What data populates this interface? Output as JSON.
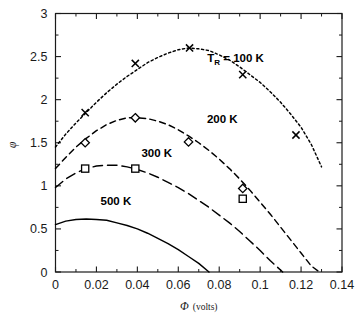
{
  "chart_data": {
    "type": "line",
    "title": "",
    "xlabel": "Φ (volts)",
    "xlabel_symbol": "Φ",
    "xlabel_units": "(volts)",
    "ylabel": "φ",
    "xlim": [
      0,
      0.14
    ],
    "ylim": [
      0,
      3
    ],
    "xticks": [
      0,
      0.02,
      0.04,
      0.06,
      0.08,
      0.1,
      0.12,
      0.14
    ],
    "xticklabels": [
      "0",
      "0.02",
      "0.04",
      "0.06",
      "0.08",
      "0.1",
      "0.12",
      "0.14"
    ],
    "yticks": [
      0,
      0.5,
      1,
      1.5,
      2,
      2.5,
      3
    ],
    "yticklabels": [
      "0",
      "0.5",
      "1",
      "1.5",
      "2",
      "2.5",
      "3"
    ],
    "grid": false,
    "legend": "inline-curve-labels",
    "minor_ticks": true,
    "series": [
      {
        "name": "100 K",
        "label": "T_R = 100 K",
        "label_prefix": "T",
        "label_subscript": "R",
        "label_suffix": " = 100 K",
        "label_x": 0.088,
        "label_y": 2.44,
        "linestyle": "dotted",
        "marker": "x",
        "color": "#000000",
        "x": [
          0,
          0.005,
          0.01,
          0.015,
          0.02,
          0.025,
          0.03,
          0.035,
          0.04,
          0.045,
          0.05,
          0.055,
          0.06,
          0.065,
          0.07,
          0.075,
          0.08,
          0.085,
          0.09,
          0.095,
          0.1,
          0.105,
          0.11,
          0.115,
          0.12,
          0.125,
          0.13
        ],
        "y": [
          1.45,
          1.6,
          1.73,
          1.85,
          1.97,
          2.08,
          2.18,
          2.27,
          2.35,
          2.43,
          2.49,
          2.54,
          2.58,
          2.6,
          2.59,
          2.57,
          2.52,
          2.46,
          2.38,
          2.29,
          2.2,
          2.09,
          1.97,
          1.83,
          1.68,
          1.48,
          1.22
        ],
        "markers_x": [
          0.0145,
          0.039,
          0.0655,
          0.0915,
          0.1175
        ],
        "markers_y": [
          1.85,
          2.42,
          2.6,
          2.29,
          1.59
        ]
      },
      {
        "name": "200 K",
        "label": "200 K",
        "label_x": 0.0815,
        "label_y": 1.73,
        "linestyle": "dashed",
        "marker": "diamond",
        "color": "#000000",
        "x": [
          0,
          0.005,
          0.01,
          0.015,
          0.02,
          0.025,
          0.03,
          0.035,
          0.04,
          0.045,
          0.05,
          0.055,
          0.06,
          0.065,
          0.07,
          0.075,
          0.08,
          0.085,
          0.09,
          0.095,
          0.1,
          0.105,
          0.11,
          0.115,
          0.12,
          0.125,
          0.129
        ],
        "y": [
          1.2,
          1.33,
          1.45,
          1.55,
          1.64,
          1.71,
          1.76,
          1.79,
          1.79,
          1.78,
          1.75,
          1.71,
          1.65,
          1.58,
          1.5,
          1.41,
          1.31,
          1.2,
          1.08,
          0.95,
          0.81,
          0.67,
          0.52,
          0.37,
          0.22,
          0.07,
          0.0
        ],
        "markers_x": [
          0.0145,
          0.039,
          0.065,
          0.0915
        ],
        "markers_y": [
          1.5,
          1.79,
          1.51,
          0.97
        ]
      },
      {
        "name": "300 K",
        "label": "300 K",
        "label_x": 0.0495,
        "label_y": 1.34,
        "linestyle": "longdash",
        "marker": "square",
        "color": "#000000",
        "x": [
          0,
          0.005,
          0.01,
          0.015,
          0.02,
          0.025,
          0.03,
          0.035,
          0.04,
          0.045,
          0.05,
          0.055,
          0.06,
          0.065,
          0.07,
          0.075,
          0.08,
          0.085,
          0.09,
          0.095,
          0.1,
          0.105,
          0.111
        ],
        "y": [
          0.98,
          1.08,
          1.15,
          1.2,
          1.23,
          1.24,
          1.24,
          1.22,
          1.19,
          1.15,
          1.1,
          1.04,
          0.98,
          0.91,
          0.83,
          0.75,
          0.66,
          0.57,
          0.47,
          0.36,
          0.25,
          0.13,
          0.0
        ],
        "markers_x": [
          0.0145,
          0.039,
          0.0915
        ],
        "markers_y": [
          1.2,
          1.2,
          0.85
        ]
      },
      {
        "name": "500 K",
        "label": "500 K",
        "label_x": 0.0295,
        "label_y": 0.78,
        "linestyle": "solid",
        "marker": "none",
        "color": "#000000",
        "x": [
          0,
          0.005,
          0.01,
          0.015,
          0.02,
          0.025,
          0.03,
          0.035,
          0.04,
          0.045,
          0.05,
          0.055,
          0.06,
          0.065,
          0.07,
          0.075
        ],
        "y": [
          0.55,
          0.59,
          0.61,
          0.615,
          0.61,
          0.6,
          0.57,
          0.54,
          0.5,
          0.45,
          0.39,
          0.33,
          0.26,
          0.18,
          0.1,
          0.0
        ],
        "markers_x": [],
        "markers_y": []
      }
    ]
  },
  "figure": {
    "background": "#ffffff",
    "axis_color": "#1a1a1a"
  }
}
